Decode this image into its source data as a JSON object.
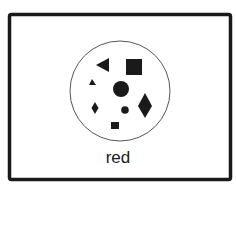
{
  "card": {
    "label": "red",
    "frame_color": "#1a1a1a",
    "shape_color": "#1a1a1a",
    "circle_stroke": "#555555"
  },
  "shapes": [
    {
      "type": "triangle-left",
      "name": "large-triangle"
    },
    {
      "type": "square",
      "name": "large-square"
    },
    {
      "type": "triangle",
      "name": "small-triangle"
    },
    {
      "type": "circle",
      "name": "large-circle"
    },
    {
      "type": "diamond",
      "name": "small-diamond"
    },
    {
      "type": "circle",
      "name": "small-circle"
    },
    {
      "type": "diamond",
      "name": "large-diamond"
    },
    {
      "type": "square",
      "name": "small-square"
    }
  ]
}
